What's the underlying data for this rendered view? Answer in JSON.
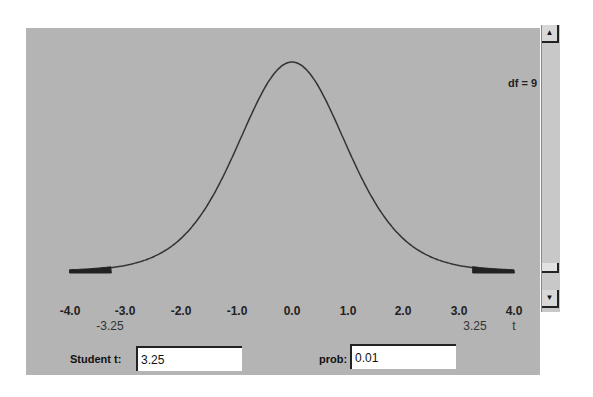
{
  "header": {
    "df_label": "df = 9"
  },
  "axis": {
    "ticks": [
      "-4.0",
      "-3.0",
      "-2.0",
      "-1.0",
      "0.0",
      "1.0",
      "2.0",
      "3.0",
      "4.0"
    ],
    "xlabel": "t",
    "critical_left": "-3.25",
    "critical_right": "3.25"
  },
  "controls": {
    "student_t_label": "Student t:",
    "student_t_value": "3.25",
    "prob_label": "prob:",
    "prob_value": "0.01"
  },
  "scrollbar": {
    "up_icon": "▲",
    "down_icon": "▼"
  },
  "chart_data": {
    "type": "line",
    "annotation": "df = 9",
    "xlabel": "t",
    "ylabel": "",
    "xlim": [
      -4.0,
      4.0
    ],
    "x_ticks": [
      -4.0,
      -3.0,
      -2.0,
      -1.0,
      0.0,
      1.0,
      2.0,
      3.0,
      4.0
    ],
    "grid": false,
    "series": [
      {
        "name": "t pdf (df=9)",
        "x": [
          -4.0,
          -3.5,
          -3.0,
          -2.5,
          -2.0,
          -1.5,
          -1.0,
          -0.5,
          0.0,
          0.5,
          1.0,
          1.5,
          2.0,
          2.5,
          3.0,
          3.5,
          4.0
        ],
        "values": [
          0.0035,
          0.0072,
          0.015,
          0.0314,
          0.0611,
          0.1092,
          0.2304,
          0.3458,
          0.388,
          0.3458,
          0.2304,
          0.1092,
          0.0611,
          0.0314,
          0.015,
          0.0072,
          0.0035
        ]
      }
    ],
    "shaded_regions": [
      {
        "from": -4.0,
        "to": -3.25,
        "label": "-3.25"
      },
      {
        "from": 3.25,
        "to": 4.0,
        "label": "3.25"
      }
    ],
    "student_t": 3.25,
    "prob": 0.01
  }
}
